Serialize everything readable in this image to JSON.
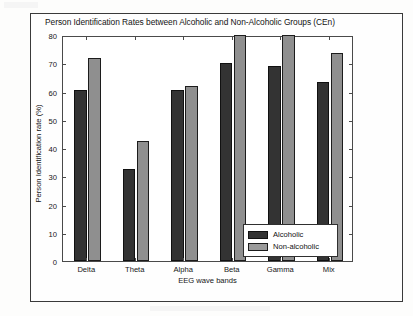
{
  "figure": {
    "title": "Person Identification Rates between Alcoholic and Non-Alcoholic Groups (CEn)"
  },
  "chart_data": {
    "type": "bar",
    "title": "Person Identification Rates between Alcoholic and Non-Alcoholic Groups (CEn)",
    "xlabel": "EEG wave bands",
    "ylabel": "Person Identification rate (%)",
    "categories": [
      "Delta",
      "Theta",
      "Alpha",
      "Beta",
      "Gamma",
      "Mix"
    ],
    "series": [
      {
        "name": "Alcoholic",
        "color": "#333333",
        "values": [
          60.5,
          32.5,
          60.5,
          70.0,
          69.0,
          63.5
        ]
      },
      {
        "name": "Non-alcoholic",
        "color": "#8f8f8f",
        "values": [
          72.0,
          42.5,
          62.0,
          80.0,
          80.0,
          73.5
        ]
      }
    ],
    "ylim": [
      0,
      80
    ],
    "yticks": [
      0,
      10,
      20,
      30,
      40,
      50,
      60,
      70,
      80
    ],
    "grid": false,
    "legend_position": "lower right"
  },
  "legend": {
    "items": [
      {
        "label": "Alcoholic"
      },
      {
        "label": "Non-alcoholic"
      }
    ]
  }
}
